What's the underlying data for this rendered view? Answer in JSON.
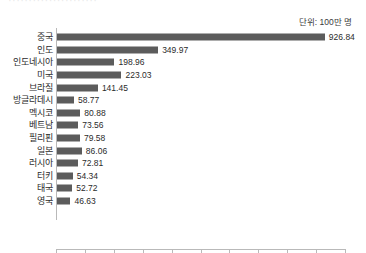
{
  "clipped_title": "······················",
  "unit_note": "단위: 100만 명",
  "chart_data": {
    "type": "bar",
    "orientation": "horizontal",
    "title": "",
    "subtitle": "",
    "annotation": "단위: 100만 명",
    "xlabel": "",
    "ylabel": "",
    "xlim": [
      0,
      1000
    ],
    "xticks": [
      0,
      100,
      200,
      300,
      400,
      500,
      600,
      700,
      800,
      900,
      1000
    ],
    "xtick_labels": [
      "0",
      "100",
      "200",
      "300",
      "400",
      "500",
      "600",
      "700",
      "800",
      "900",
      "1,000"
    ],
    "grid": false,
    "legend": false,
    "bar_color": "#5c5c5c",
    "axis_color": "#b9b9b9",
    "categories": [
      "중국",
      "인도",
      "인도네시아",
      "미국",
      "브라질",
      "방글라데시",
      "멕시코",
      "베트남",
      "필리핀",
      "일본",
      "러시아",
      "터키",
      "태국",
      "영국"
    ],
    "values": [
      926.84,
      349.97,
      198.96,
      223.03,
      141.45,
      58.77,
      80.88,
      73.56,
      79.58,
      86.06,
      72.81,
      54.34,
      52.72,
      46.63
    ],
    "value_labels": [
      "926.84",
      "349.97",
      "198.96",
      "223.03",
      "141.45",
      "58.77",
      "80.88",
      "73.56",
      "79.58",
      "86.06",
      "72.81",
      "54.34",
      "52.72",
      "46.63"
    ]
  }
}
